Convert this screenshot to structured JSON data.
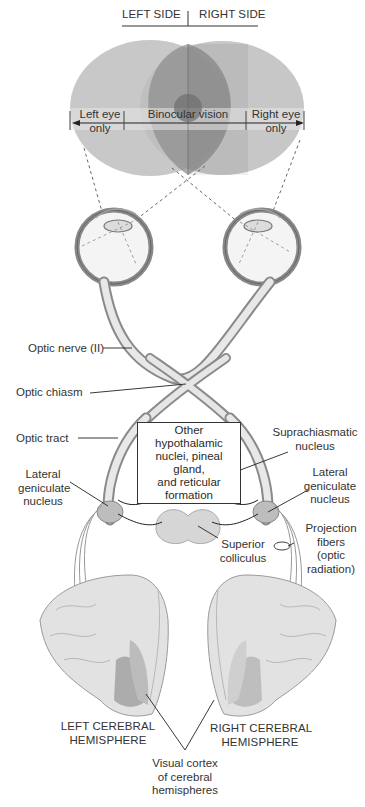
{
  "header": {
    "left_side": "LEFT SIDE",
    "right_side": "RIGHT SIDE"
  },
  "visual_field": {
    "left_eye_only": [
      "Left eye",
      "only"
    ],
    "binocular": "Binocular vision",
    "right_eye_only": [
      "Right eye",
      "only"
    ],
    "colors": {
      "left_field": "#c9c9c9",
      "right_field": "#b9b9b9",
      "binocular": "#9a9a9a",
      "center": "#7a7a7a",
      "band": "#dedede"
    }
  },
  "labels": {
    "optic_nerve": "Optic nerve (II)",
    "optic_chiasm": "Optic chiasm",
    "optic_tract": "Optic tract",
    "other_nuclei": [
      "Other hypothalamic",
      "nuclei, pineal gland,",
      "and reticular",
      "formation"
    ],
    "suprachiasmatic": [
      "Suprachiasmatic",
      "nucleus"
    ],
    "lgn_left": [
      "Lateral",
      "geniculate",
      "nucleus"
    ],
    "lgn_right": [
      "Lateral",
      "geniculate",
      "nucleus"
    ],
    "superior_colliculus": [
      "Superior",
      "colliculus"
    ],
    "projection_fibers": [
      "Projection",
      "fibers",
      "(optic",
      "radiation)"
    ],
    "left_hemisphere": [
      "LEFT CEREBRAL",
      "HEMISPHERE"
    ],
    "right_hemisphere": [
      "RIGHT CEREBRAL",
      "HEMISPHERE"
    ],
    "visual_cortex": [
      "Visual cortex",
      "of cerebral",
      "hemispheres"
    ]
  }
}
